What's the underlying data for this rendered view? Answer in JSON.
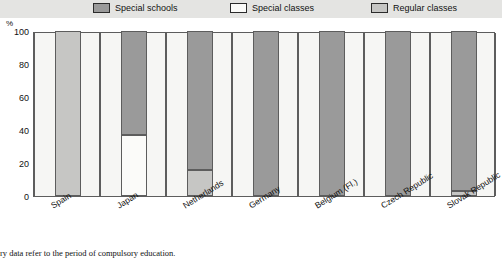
{
  "legend": {
    "items": [
      {
        "label": "Special schools",
        "color": "#9a9a9a",
        "icon": "legend-swatch-icon"
      },
      {
        "label": "Special classes",
        "color": "#fbfbf9",
        "icon": "legend-swatch-icon"
      },
      {
        "label": "Regular classes",
        "color": "#c6c6c4",
        "icon": "legend-swatch-icon"
      }
    ]
  },
  "axis": {
    "unit": "%",
    "y_ticks": [
      "100",
      "80",
      "60",
      "40",
      "20",
      "0"
    ]
  },
  "footnote": "ry data refer to the period of compulsory education.",
  "chart_data": {
    "type": "bar",
    "title": "",
    "subtitle": "",
    "xlabel": "",
    "ylabel": "%",
    "ylim": [
      0,
      100
    ],
    "yticks": [
      0,
      20,
      40,
      60,
      80,
      100
    ],
    "grid": false,
    "stacked": true,
    "legend_position": "top",
    "categories": [
      "Spain",
      "Japan",
      "Netherlands",
      "Germany",
      "Belgium (Fl.)",
      "Czech Republic",
      "Slovak Republic"
    ],
    "series": [
      {
        "name": "Special schools",
        "color": "#9a9a9a",
        "values": [
          0,
          63,
          84,
          100,
          100,
          100,
          97
        ]
      },
      {
        "name": "Special classes",
        "color": "#fbfbf9",
        "values": [
          0,
          37,
          0,
          0,
          0,
          0,
          0
        ]
      },
      {
        "name": "Regular classes",
        "color": "#c6c6c4",
        "values": [
          100,
          0,
          16,
          0,
          0,
          0,
          3
        ]
      }
    ]
  }
}
